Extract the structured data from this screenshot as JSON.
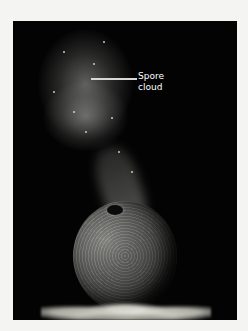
{
  "figure": {
    "annotation": {
      "line1": "Spore",
      "line2": "cloud"
    }
  },
  "colors": {
    "background": "#f4f4f2",
    "photo_background": "#030303",
    "label_text": "#ffffff",
    "leader_line": "#d8d8d8"
  }
}
